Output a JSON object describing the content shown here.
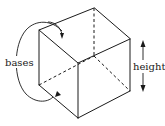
{
  "diagram": {
    "labels": {
      "bases": "bases",
      "height": "height"
    },
    "colors": {
      "line": "#1a1a1a",
      "background": "#ffffff"
    }
  }
}
